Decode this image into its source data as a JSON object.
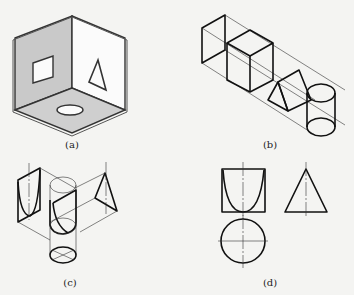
{
  "figure": {
    "panels": [
      {
        "id": "a",
        "caption": "(a)",
        "description": "Three mutually perpendicular projection planes (corner box) with a square hole in the left plane, a triangular hole in the right plane, and an elliptical hole in the bottom plane"
      },
      {
        "id": "b",
        "caption": "(b)",
        "description": "Parallel projection of a cube, a triangular prism and a cylinder along a common axis"
      },
      {
        "id": "c",
        "caption": "(c)",
        "description": "Isometric view of a cone-like solid with projection lines to three planes"
      },
      {
        "id": "d",
        "caption": "(d)",
        "description": "Three orthographic views: front view (square with parabolic curve), side view (triangle), top view (circle with center lines)"
      }
    ]
  },
  "colors": {
    "background": "#f4f4f2",
    "line": "#111111",
    "plane_fill": "#c8c8c8"
  }
}
